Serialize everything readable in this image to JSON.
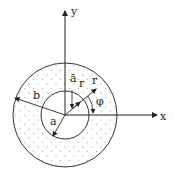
{
  "figure": {
    "axis_x_label": "x",
    "axis_y_label": "y",
    "outer_radius_label": "b",
    "inner_radius_label": "a",
    "unit_vector_label": "ā",
    "unit_vector_sub": "r",
    "radial_label": "r",
    "angle_label": "φ"
  }
}
